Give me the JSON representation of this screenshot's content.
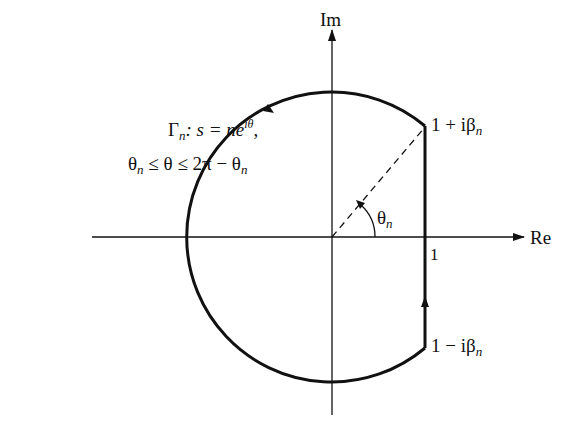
{
  "diagram": {
    "axes": {
      "x_label": "Re",
      "y_label": "Im",
      "tick_label_one": "1"
    },
    "contour": {
      "name_symbol": "Γ",
      "name_sub": "n",
      "definition_prefix": ": s = ne",
      "definition_sup": "iθ",
      "definition_suffix": ",",
      "range_prefix": "θ",
      "range_sub1": "n",
      "range_mid": " ≤ θ ≤ 2π − θ",
      "range_sub2": "n"
    },
    "angle": {
      "symbol": "θ",
      "sub": "n"
    },
    "points": {
      "upper": {
        "text": "1 + iβ",
        "sub": "n"
      },
      "lower": {
        "text": "1 − iβ",
        "sub": "n"
      }
    },
    "colors": {
      "stroke": "#111111",
      "background": "#ffffff"
    }
  }
}
